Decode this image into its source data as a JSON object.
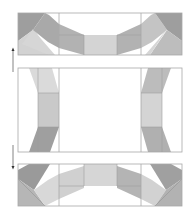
{
  "diagram": {
    "colors": {
      "background": "#ffffff",
      "outline": "#a8a8a8",
      "dark": "#9a9a9a",
      "medium": "#b4b4b4",
      "light": "#cfcfcf",
      "lighter": "#dcdcdc",
      "arrow": "#555555"
    },
    "panels": [
      {
        "name": "top-row",
        "x": 18,
        "y": 13,
        "w": 164,
        "h": 42
      },
      {
        "name": "middle-row",
        "x": 18,
        "y": 68,
        "w": 164,
        "h": 84
      },
      {
        "name": "bottom-row",
        "x": 18,
        "y": 164,
        "w": 164,
        "h": 42
      }
    ],
    "arrows": [
      {
        "name": "up-arrow",
        "direction": "up",
        "x": 13,
        "y1": 72,
        "y2": 48
      },
      {
        "name": "down-arrow",
        "direction": "down",
        "x": 13,
        "y1": 145,
        "y2": 169
      }
    ]
  }
}
